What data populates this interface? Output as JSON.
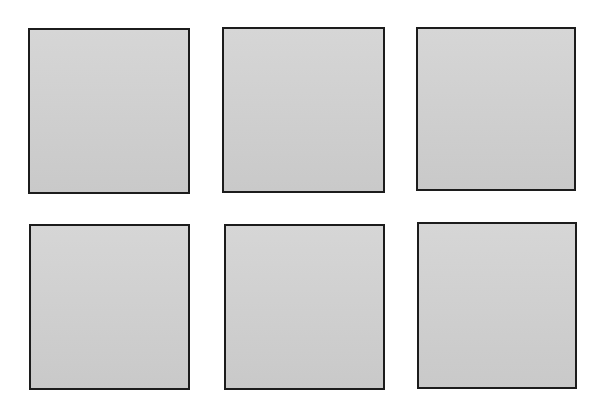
{
  "background_color": "#ffffff",
  "panel_style": {
    "border_color": "#1c1c1c",
    "fill_top": "#d6d6d6",
    "fill_bottom": "#c9c9c9"
  },
  "panels": [
    {
      "row": 1,
      "col": 1,
      "left": 28,
      "top": 28,
      "width": 162,
      "height": 166
    },
    {
      "row": 1,
      "col": 2,
      "left": 222,
      "top": 27,
      "width": 163,
      "height": 166
    },
    {
      "row": 1,
      "col": 3,
      "left": 416,
      "top": 27,
      "width": 160,
      "height": 164
    },
    {
      "row": 2,
      "col": 1,
      "left": 29,
      "top": 224,
      "width": 161,
      "height": 166
    },
    {
      "row": 2,
      "col": 2,
      "left": 224,
      "top": 224,
      "width": 161,
      "height": 166
    },
    {
      "row": 2,
      "col": 3,
      "left": 417,
      "top": 222,
      "width": 160,
      "height": 167
    }
  ]
}
